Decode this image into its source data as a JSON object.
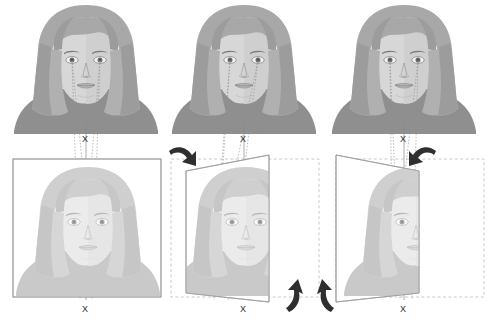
{
  "figure": {
    "background_color": "#ffffff",
    "ink_color": "#3a3a3a",
    "ray_color": "#8a8a8a",
    "plane_stroke": "#9a9a9a",
    "dashed_stroke": "#b9b9b9",
    "arrow_color": "#2f2f2f"
  },
  "labels": {
    "x_marker": "X"
  },
  "panels": [
    {
      "id": "panel-frontal",
      "name": "frontal-projection",
      "plane_state": "unrotated",
      "x_upper": "X",
      "x_lower": "X",
      "rotation_arrows": []
    },
    {
      "id": "panel-rotated-left",
      "name": "plane-rotated-left",
      "plane_state": "rotated-left",
      "x_upper": "X",
      "x_lower": "X",
      "rotation_arrows": [
        "top-left-down",
        "bottom-right-up"
      ]
    },
    {
      "id": "panel-rotated-right",
      "name": "plane-rotated-right",
      "plane_state": "rotated-right",
      "x_upper": "X",
      "x_lower": "X",
      "rotation_arrows": [
        "top-right-down",
        "bottom-left-up"
      ]
    }
  ],
  "portrait": {
    "hair_color": "#a8a8a8",
    "hair_shadow": "#949494",
    "skin_color": "#d7d7d7",
    "skin_shadow": "#c4c4c4",
    "shirt_color": "#8f8f8f",
    "feature_color": "#7a7a7a",
    "faded_hair_color": "#cfcfcf",
    "faded_skin_color": "#ebebeb",
    "faded_shirt_color": "#c9c9c9",
    "faded_feature_color": "#b5b5b5"
  }
}
